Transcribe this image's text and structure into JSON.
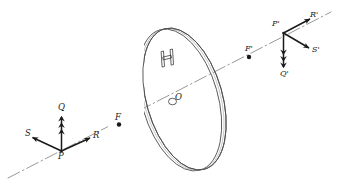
{
  "figure": {
    "type": "optics-ray-diagram",
    "background_color": "#ffffff",
    "ink_color": "#1a1a1a",
    "axis_color": "#8a8a8a",
    "lens_color": "#555555"
  },
  "labels": {
    "P": "P",
    "Q": "Q",
    "R": "R",
    "S": "S",
    "F": "F",
    "O": "O",
    "H": "H",
    "F_prime": "F'",
    "P_prime": "P'",
    "Q_prime": "Q'",
    "R_prime": "R'",
    "S_prime": "S'"
  },
  "elements": {
    "optical_axis": "dash-dot optical axis running lower-left to upper-right",
    "lens": "tilted circular thin lens shown in perspective with edge thickness",
    "object_point": "P",
    "image_point": "P'",
    "object_focal_point": "F",
    "image_focal_point": "F'",
    "lens_center": "O",
    "lens_mark": "H",
    "object_vectors": [
      "Q",
      "R",
      "S"
    ],
    "image_vectors": [
      "Q'",
      "R'",
      "S'"
    ]
  },
  "vectors": {
    "Q": {
      "from": "P",
      "direction": "up",
      "style": "triple-arrowhead"
    },
    "R": {
      "from": "P",
      "direction": "up-right",
      "style": "single-arrowhead"
    },
    "S": {
      "from": "P",
      "direction": "up-left",
      "style": "single-arrowhead"
    },
    "Q'": {
      "from": "P'",
      "direction": "down",
      "style": "triple-arrowhead"
    },
    "R'": {
      "from": "P'",
      "direction": "up-right",
      "style": "single-arrowhead"
    },
    "S'": {
      "from": "P'",
      "direction": "down-right",
      "style": "single-arrowhead"
    }
  }
}
